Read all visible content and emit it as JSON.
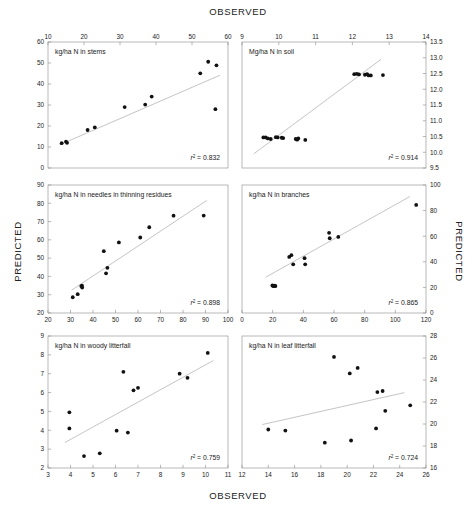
{
  "figure": {
    "axis_titles": {
      "observed_top": "OBSERVED",
      "observed_bottom": "OBSERVED",
      "predicted_left": "PREDICTED",
      "predicted_right": "PREDICTED"
    }
  },
  "chart_data": [
    {
      "id": "stems",
      "type": "scatter",
      "title": "kg/ha N in stems",
      "xlabel": "OBSERVED",
      "ylabel": "PREDICTED",
      "xlim": [
        10,
        60
      ],
      "ylim": [
        0,
        60
      ],
      "xticks": [
        10,
        20,
        30,
        40,
        50,
        60
      ],
      "yticks": [
        0,
        10,
        20,
        30,
        40,
        50,
        60
      ],
      "x_axis_position": "top",
      "y_axis_position": "left",
      "grid": false,
      "annotation": "r2 = 0.832",
      "r2": 0.832,
      "points": [
        {
          "x": 13.8,
          "y": 11.8
        },
        {
          "x": 15.0,
          "y": 12.6
        },
        {
          "x": 15.3,
          "y": 12.0
        },
        {
          "x": 21.0,
          "y": 18.1
        },
        {
          "x": 23.0,
          "y": 19.3
        },
        {
          "x": 31.3,
          "y": 29.0
        },
        {
          "x": 37.0,
          "y": 30.2
        },
        {
          "x": 38.8,
          "y": 34.0
        },
        {
          "x": 52.3,
          "y": 45.1
        },
        {
          "x": 54.5,
          "y": 50.6
        },
        {
          "x": 56.8,
          "y": 48.9
        },
        {
          "x": 56.5,
          "y": 28.0
        }
      ],
      "fit_line": {
        "x": [
          13.2,
          57.8
        ],
        "y": [
          11.0,
          44.2
        ]
      }
    },
    {
      "id": "soil",
      "type": "scatter",
      "title": "Mg/ha N in soil",
      "xlabel": "OBSERVED",
      "ylabel": "PREDICTED",
      "xlim": [
        9,
        14
      ],
      "ylim": [
        9.5,
        13.5
      ],
      "xticks": [
        9,
        10,
        11,
        12,
        13,
        14
      ],
      "yticks": [
        9.5,
        10.0,
        10.5,
        11.0,
        11.5,
        12.0,
        12.5,
        13.0,
        13.5
      ],
      "x_axis_position": "top",
      "y_axis_position": "right",
      "grid": false,
      "annotation": "r2 = 0.914",
      "r2": 0.914,
      "points": [
        {
          "x": 9.58,
          "y": 10.47
        },
        {
          "x": 9.64,
          "y": 10.47
        },
        {
          "x": 9.7,
          "y": 10.44
        },
        {
          "x": 9.78,
          "y": 10.42
        },
        {
          "x": 9.92,
          "y": 10.48
        },
        {
          "x": 9.97,
          "y": 10.47
        },
        {
          "x": 10.08,
          "y": 10.46
        },
        {
          "x": 10.12,
          "y": 10.45
        },
        {
          "x": 10.46,
          "y": 10.42
        },
        {
          "x": 10.5,
          "y": 10.4
        },
        {
          "x": 10.53,
          "y": 10.44
        },
        {
          "x": 10.72,
          "y": 10.39
        },
        {
          "x": 12.05,
          "y": 12.48
        },
        {
          "x": 12.12,
          "y": 12.49
        },
        {
          "x": 12.18,
          "y": 12.47
        },
        {
          "x": 12.34,
          "y": 12.46
        },
        {
          "x": 12.4,
          "y": 12.48
        },
        {
          "x": 12.44,
          "y": 12.44
        },
        {
          "x": 12.5,
          "y": 12.44
        },
        {
          "x": 12.83,
          "y": 12.45
        }
      ],
      "fit_line": {
        "x": [
          9.32,
          12.78
        ],
        "y": [
          9.95,
          12.95
        ]
      }
    },
    {
      "id": "needles-thinning-residues",
      "type": "scatter",
      "title": "kg/ha N in needles in thinning residues",
      "xlabel": "OBSERVED",
      "ylabel": "PREDICTED",
      "xlim": [
        20,
        100
      ],
      "ylim": [
        20,
        90
      ],
      "xticks": [
        20,
        30,
        40,
        50,
        60,
        70,
        80,
        90,
        100
      ],
      "yticks": [
        20,
        30,
        40,
        50,
        60,
        70,
        80,
        90
      ],
      "x_axis_position": "bottom",
      "y_axis_position": "left",
      "grid": false,
      "annotation": "r2 = 0.898",
      "r2": 0.898,
      "points": [
        {
          "x": 31.0,
          "y": 28.6
        },
        {
          "x": 33.2,
          "y": 30.3
        },
        {
          "x": 34.8,
          "y": 34.7
        },
        {
          "x": 35.1,
          "y": 35.0
        },
        {
          "x": 35.2,
          "y": 33.9
        },
        {
          "x": 44.8,
          "y": 53.8
        },
        {
          "x": 45.8,
          "y": 41.7
        },
        {
          "x": 46.4,
          "y": 44.7
        },
        {
          "x": 51.5,
          "y": 58.6
        },
        {
          "x": 61.0,
          "y": 61.3
        },
        {
          "x": 65.0,
          "y": 66.9
        },
        {
          "x": 75.8,
          "y": 73.2
        },
        {
          "x": 89.2,
          "y": 73.3
        }
      ],
      "fit_line": {
        "x": [
          30.5,
          90.5
        ],
        "y": [
          32.5,
          81.5
        ]
      }
    },
    {
      "id": "branches",
      "type": "scatter",
      "title": "kg/ha N in branches",
      "xlabel": "OBSERVED",
      "ylabel": "PREDICTED",
      "xlim": [
        0,
        120
      ],
      "ylim": [
        0,
        100
      ],
      "xticks": [
        0,
        20,
        40,
        60,
        80,
        100,
        120
      ],
      "yticks": [
        0,
        20,
        40,
        60,
        80,
        100
      ],
      "x_axis_position": "bottom",
      "y_axis_position": "right",
      "grid": false,
      "annotation": "r2 = 0.865",
      "r2": 0.865,
      "points": [
        {
          "x": 19.8,
          "y": 21.5
        },
        {
          "x": 20.4,
          "y": 21.0
        },
        {
          "x": 20.9,
          "y": 21.2
        },
        {
          "x": 21.4,
          "y": 21.3
        },
        {
          "x": 21.8,
          "y": 21.0
        },
        {
          "x": 30.8,
          "y": 43.8
        },
        {
          "x": 32.2,
          "y": 45.2
        },
        {
          "x": 33.4,
          "y": 38.0
        },
        {
          "x": 40.8,
          "y": 42.8
        },
        {
          "x": 41.2,
          "y": 38.0
        },
        {
          "x": 56.8,
          "y": 62.6
        },
        {
          "x": 57.2,
          "y": 58.4
        },
        {
          "x": 62.8,
          "y": 59.4
        },
        {
          "x": 113.6,
          "y": 84.4
        }
      ],
      "fit_line": {
        "x": [
          15.5,
          109.5
        ],
        "y": [
          28.0,
          91.0
        ]
      }
    },
    {
      "id": "woody-litterfall",
      "type": "scatter",
      "title": "kg/ha N in woody litterfall",
      "xlabel": "OBSERVED",
      "ylabel": "PREDICTED",
      "xlim": [
        3,
        11
      ],
      "ylim": [
        2,
        9
      ],
      "xticks": [
        3,
        4,
        5,
        6,
        7,
        8,
        9,
        10,
        11
      ],
      "yticks": [
        2,
        3,
        4,
        5,
        6,
        7,
        8,
        9
      ],
      "x_axis_position": "bottom",
      "y_axis_position": "left",
      "grid": false,
      "annotation": "r2 = 0.759",
      "r2": 0.759,
      "points": [
        {
          "x": 3.95,
          "y": 4.95
        },
        {
          "x": 3.95,
          "y": 4.1
        },
        {
          "x": 4.6,
          "y": 2.63
        },
        {
          "x": 5.3,
          "y": 2.78
        },
        {
          "x": 6.05,
          "y": 3.98
        },
        {
          "x": 6.35,
          "y": 7.1
        },
        {
          "x": 6.55,
          "y": 3.88
        },
        {
          "x": 6.8,
          "y": 6.12
        },
        {
          "x": 7.0,
          "y": 6.25
        },
        {
          "x": 8.85,
          "y": 7.0
        },
        {
          "x": 9.2,
          "y": 6.78
        },
        {
          "x": 10.1,
          "y": 8.1
        }
      ],
      "fit_line": {
        "x": [
          3.75,
          10.35
        ],
        "y": [
          3.35,
          7.7
        ]
      }
    },
    {
      "id": "leaf-litterfall",
      "type": "scatter",
      "title": "kg/ha N in leaf litterfall",
      "xlabel": "OBSERVED",
      "ylabel": "PREDICTED",
      "xlim": [
        12,
        26
      ],
      "ylim": [
        16,
        28
      ],
      "xticks": [
        12,
        14,
        16,
        18,
        20,
        22,
        24,
        26
      ],
      "yticks": [
        16,
        18,
        20,
        22,
        24,
        26,
        28
      ],
      "x_axis_position": "bottom",
      "y_axis_position": "right",
      "grid": false,
      "annotation": "r2 = 0.724",
      "r2": 0.724,
      "points": [
        {
          "x": 14.0,
          "y": 19.5
        },
        {
          "x": 15.3,
          "y": 19.4
        },
        {
          "x": 18.3,
          "y": 18.3
        },
        {
          "x": 19.0,
          "y": 26.1
        },
        {
          "x": 20.2,
          "y": 24.6
        },
        {
          "x": 20.3,
          "y": 18.5
        },
        {
          "x": 20.8,
          "y": 25.1
        },
        {
          "x": 22.2,
          "y": 19.6
        },
        {
          "x": 22.3,
          "y": 22.9
        },
        {
          "x": 22.7,
          "y": 23.0
        },
        {
          "x": 22.9,
          "y": 21.2
        },
        {
          "x": 24.8,
          "y": 21.7
        }
      ],
      "fit_line": {
        "x": [
          13.55,
          24.35
        ],
        "y": [
          19.95,
          22.85
        ]
      }
    }
  ]
}
